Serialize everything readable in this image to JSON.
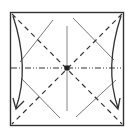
{
  "diagram": {
    "colors": {
      "paper_border": "#333333",
      "valley_fold": "#333333",
      "mountain_fold": "#333333",
      "thin_crease": "#555555",
      "center_crease": "#888888",
      "arrow": "#333333",
      "background": "#ffffff"
    },
    "square": {
      "x": 10,
      "y": 12,
      "size": 113
    },
    "center": {
      "x": 67,
      "y": 68
    },
    "folds": [
      {
        "type": "valley",
        "label": "diagonal-tl-br"
      },
      {
        "type": "valley",
        "label": "diagonal-tr-bl"
      },
      {
        "type": "mountain",
        "label": "horizontal-center"
      },
      {
        "type": "crease",
        "label": "vertical-center"
      },
      {
        "type": "crease",
        "label": "diamond-edges"
      }
    ],
    "arrows": [
      {
        "side": "left",
        "direction": "down"
      },
      {
        "side": "right",
        "direction": "down"
      }
    ]
  }
}
